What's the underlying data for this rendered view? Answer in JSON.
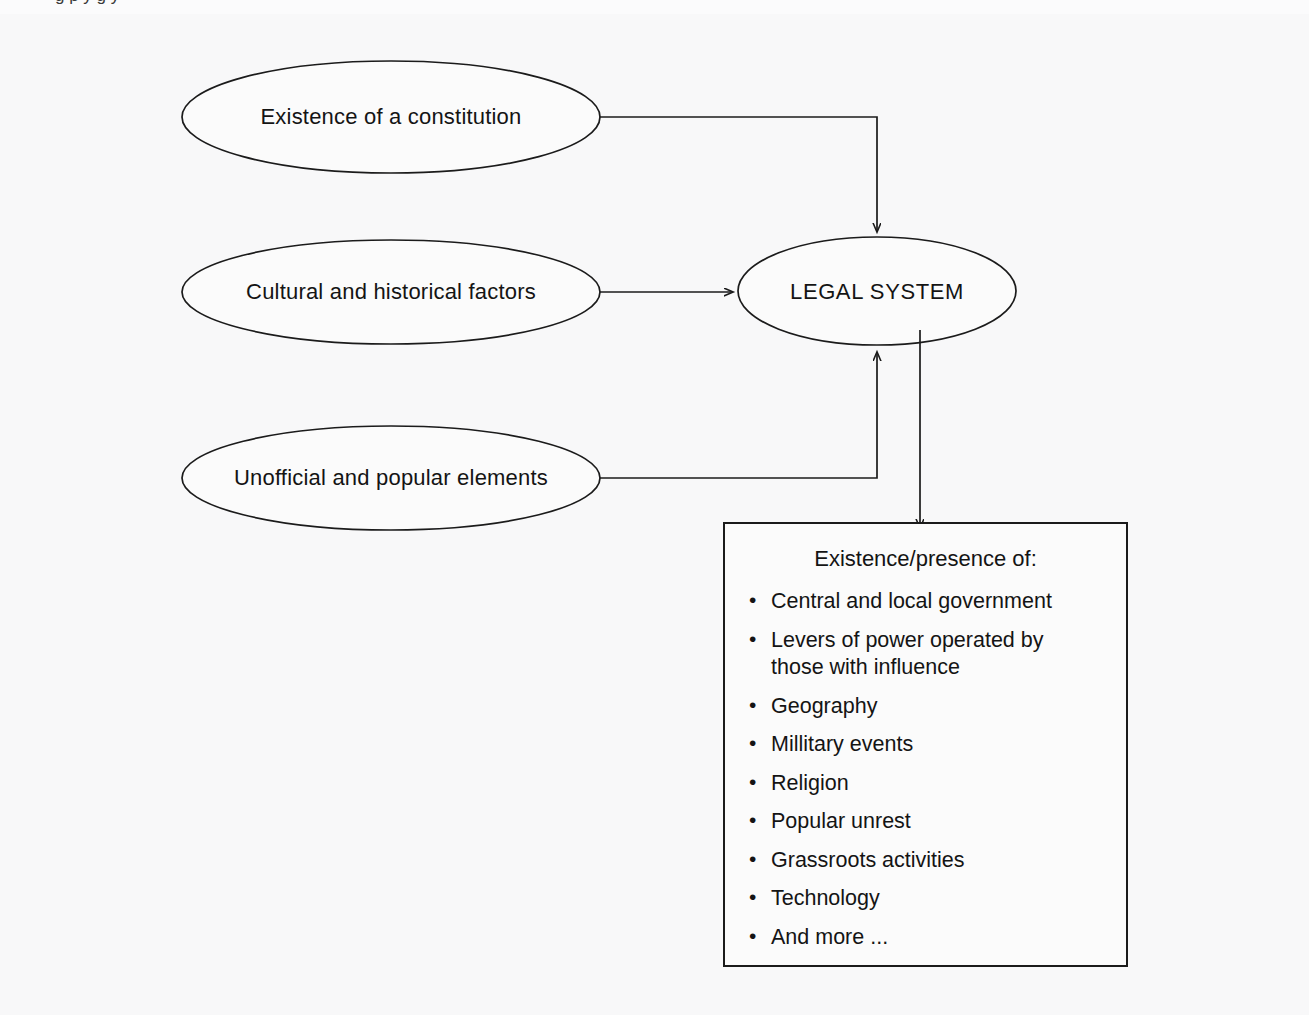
{
  "figure": {
    "background_color": "#f8f8f9",
    "stroke_color": "#1b1b1b",
    "caption_fragment": "g                    p              y    g   y"
  },
  "diagram": {
    "type": "flow-diagram",
    "central_node": {
      "id": "legal-system",
      "label": "LEGAL SYSTEM",
      "shape": "ellipse"
    },
    "input_nodes": [
      {
        "id": "constitution",
        "label": "Existence of a constitution",
        "shape": "ellipse"
      },
      {
        "id": "cultural-historical",
        "label": "Cultural and historical factors",
        "shape": "ellipse"
      },
      {
        "id": "unofficial-popular",
        "label": "Unofficial and popular elements",
        "shape": "ellipse"
      }
    ],
    "output_box": {
      "id": "existence-presence-box",
      "title": "Existence/presence of:",
      "bullet_glyph": "•",
      "items": [
        "Central and local government",
        "Levers of power operated by those with influence",
        "Geography",
        "Millitary events",
        "Religion",
        "Popular unrest",
        "Grassroots activities",
        "Technology",
        "And more ..."
      ]
    },
    "edges": [
      {
        "from": "constitution",
        "to": "legal-system",
        "style": "orthogonal",
        "arrow_at": "top-of-target"
      },
      {
        "from": "cultural-historical",
        "to": "legal-system",
        "style": "straight",
        "arrow_at": "left-of-target"
      },
      {
        "from": "unofficial-popular",
        "to": "legal-system",
        "style": "orthogonal",
        "arrow_at": "bottom-of-target"
      },
      {
        "from": "legal-system",
        "to": "existence-presence-box",
        "style": "straight-vertical",
        "arrow_at": "top-of-target"
      }
    ]
  },
  "labels": {
    "constitution": "Existence of a constitution",
    "cultural": "Cultural and historical factors",
    "unofficial": "Unofficial and popular elements",
    "legal_system": "LEGAL SYSTEM"
  },
  "bullets": {
    "glyph": "•",
    "b0": "Central and local government",
    "b1_line1": "Levers of power operated by",
    "b1_line2": "those with influence",
    "b2": "Geography",
    "b3": "Millitary events",
    "b4": "Religion",
    "b5": "Popular unrest",
    "b6": "Grassroots activities",
    "b7": "Technology",
    "b8": "And more ..."
  },
  "box": {
    "title": "Existence/presence of:"
  }
}
